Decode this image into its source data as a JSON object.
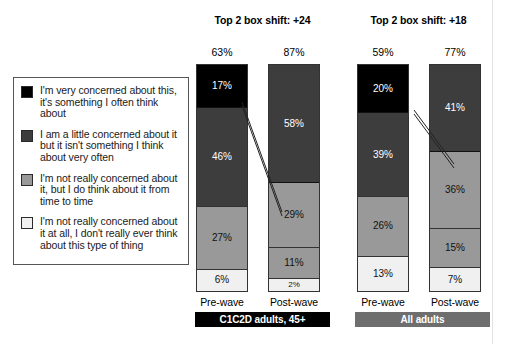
{
  "legend": {
    "items": [
      {
        "color": "#000000",
        "label": "I'm very concerned about this, it's something I often think about"
      },
      {
        "color": "#3d3d3d",
        "label": "I am a little concerned about it but it isn't something I think about very often"
      },
      {
        "color": "#999999",
        "label": "I'm not really concerned about it, but I do think about it from time to time"
      },
      {
        "color": "#f0f0f0",
        "label": "I'm not really concerned about it at all, I don't really ever think about this type of thing"
      }
    ]
  },
  "panels": {
    "left": {
      "title": "Top 2 box shift: +24",
      "banner": "C1C2D adults, 45+",
      "bars": [
        {
          "axis_label": "Pre-wave",
          "total": "63%",
          "segments": [
            {
              "value": 17,
              "label": "17%",
              "color": "#000000"
            },
            {
              "value": 46,
              "label": "46%",
              "color": "#3d3d3d"
            },
            {
              "value": 27,
              "label": "27%",
              "color": "#999999"
            },
            {
              "value": 6,
              "label": "6%",
              "color": "#f0f0f0"
            }
          ]
        },
        {
          "axis_label": "Post-wave",
          "total": "87%",
          "segments": [
            {
              "value": 58,
              "label": "58%",
              "color": "#3d3d3d"
            },
            {
              "value": 29,
              "label": "29%",
              "color": "#999999"
            },
            {
              "value": 11,
              "label": "11%",
              "color": "#999999"
            },
            {
              "value": 2,
              "label": "2%",
              "color": "#f0f0f0"
            }
          ]
        }
      ]
    },
    "right": {
      "title": "Top 2 box shift: +18",
      "banner": "All adults",
      "bars": [
        {
          "axis_label": "Pre-wave",
          "total": "59%",
          "segments": [
            {
              "value": 20,
              "label": "20%",
              "color": "#000000"
            },
            {
              "value": 39,
              "label": "39%",
              "color": "#3d3d3d"
            },
            {
              "value": 26,
              "label": "26%",
              "color": "#999999"
            },
            {
              "value": 13,
              "label": "13%",
              "color": "#f0f0f0"
            }
          ]
        },
        {
          "axis_label": "Post-wave",
          "total": "77%",
          "segments": [
            {
              "value": 41,
              "label": "41%",
              "color": "#3d3d3d"
            },
            {
              "value": 36,
              "label": "36%",
              "color": "#999999"
            },
            {
              "value": 15,
              "label": "15%",
              "color": "#999999"
            },
            {
              "value": 7,
              "label": "7%",
              "color": "#f0f0f0"
            }
          ]
        }
      ]
    }
  },
  "chart_data": {
    "type": "bar",
    "title": "",
    "xlabel": "",
    "ylabel": "",
    "ylim": [
      0,
      100
    ],
    "grid": false,
    "legend_position": "left",
    "stacked": true,
    "charts": [
      {
        "title": "Top 2 box shift: +24",
        "audience": "C1C2D adults, 45+",
        "categories": [
          "Pre-wave",
          "Post-wave"
        ],
        "totals_top2box": [
          "63%",
          "87%"
        ],
        "series": [
          {
            "name": "I'm very concerned about this, it's something I often think about",
            "values": [
              17,
              0
            ]
          },
          {
            "name": "I am a little concerned about it but it isn't something I think about very often",
            "values": [
              46,
              58
            ]
          },
          {
            "name": "I'm not really concerned about it, but I do think about it from time to time",
            "values": [
              27,
              29
            ]
          },
          {
            "name": "I'm not really concerned about it at all, I don't really ever think about this type of thing",
            "values": [
              6,
              11
            ]
          },
          {
            "name": "remainder",
            "values": [
              0,
              2
            ]
          }
        ]
      },
      {
        "title": "Top 2 box shift: +18",
        "audience": "All adults",
        "categories": [
          "Pre-wave",
          "Post-wave"
        ],
        "totals_top2box": [
          "59%",
          "77%"
        ],
        "series": [
          {
            "name": "I'm very concerned about this, it's something I often think about",
            "values": [
              20,
              0
            ]
          },
          {
            "name": "I am a little concerned about it but it isn't something I think about very often",
            "values": [
              39,
              41
            ]
          },
          {
            "name": "I'm not really concerned about it, but I do think about it from time to time",
            "values": [
              26,
              36
            ]
          },
          {
            "name": "I'm not really concerned about it at all, I don't really ever think about this type of thing",
            "values": [
              13,
              15
            ]
          },
          {
            "name": "remainder",
            "values": [
              0,
              7
            ]
          }
        ]
      }
    ]
  }
}
